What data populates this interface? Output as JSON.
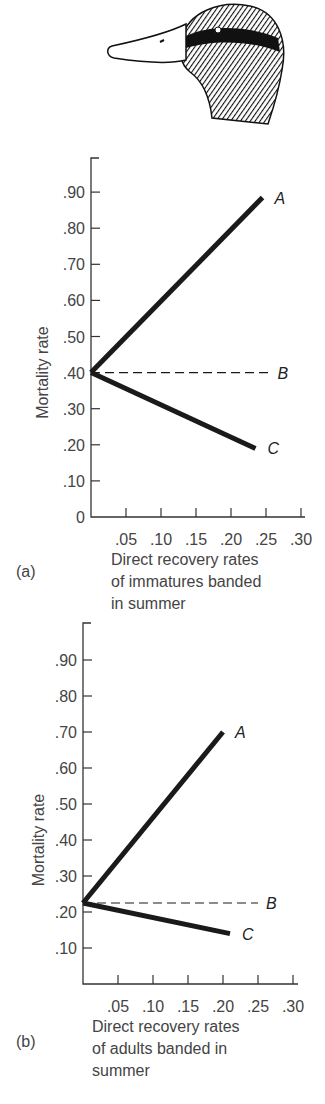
{
  "illustration": {
    "name": "mallard duck head"
  },
  "chart_data": [
    {
      "type": "line",
      "panel": "(a)",
      "title": "",
      "xlabel": "Direct recovery rates of immatures banded in summer",
      "xlabel_lines": [
        "Direct recovery rates",
        "of immatures banded",
        "in summer"
      ],
      "ylabel": "Mortality rate",
      "x_ticks": [
        ".05",
        ".10",
        ".15",
        ".20",
        ".25",
        ".30"
      ],
      "y_ticks": [
        "0",
        ".10",
        ".20",
        ".30",
        ".40",
        ".50",
        ".60",
        ".70",
        ".80",
        ".90"
      ],
      "xlim": [
        0,
        0.3
      ],
      "ylim": [
        0,
        1.0
      ],
      "grid": false,
      "series": [
        {
          "name": "A",
          "style": "solid",
          "x": [
            0,
            0.245
          ],
          "y": [
            0.4,
            0.885
          ]
        },
        {
          "name": "B",
          "style": "dashed",
          "x": [
            0,
            0.255
          ],
          "y": [
            0.4,
            0.4
          ]
        },
        {
          "name": "C",
          "style": "solid",
          "x": [
            0,
            0.235
          ],
          "y": [
            0.4,
            0.19
          ]
        }
      ]
    },
    {
      "type": "line",
      "panel": "(b)",
      "title": "",
      "xlabel": "Direct recovery rates of adults banded in summer",
      "xlabel_lines": [
        "Direct recovery rates",
        "of adults banded in",
        "summer"
      ],
      "ylabel": "Mortality rate",
      "x_ticks": [
        ".05",
        ".10",
        ".15",
        ".20",
        ".25",
        ".30"
      ],
      "y_ticks": [
        ".10",
        ".20",
        ".30",
        ".40",
        ".50",
        ".60",
        ".70",
        ".80",
        ".90"
      ],
      "xlim": [
        0,
        0.3
      ],
      "ylim": [
        0,
        1.0
      ],
      "grid": false,
      "series": [
        {
          "name": "A",
          "style": "solid",
          "x": [
            0,
            0.2
          ],
          "y": [
            0.225,
            0.7
          ]
        },
        {
          "name": "B",
          "style": "dashed",
          "x": [
            0,
            0.25
          ],
          "y": [
            0.225,
            0.225
          ]
        },
        {
          "name": "C",
          "style": "solid",
          "x": [
            0,
            0.21
          ],
          "y": [
            0.225,
            0.14
          ]
        }
      ]
    }
  ]
}
